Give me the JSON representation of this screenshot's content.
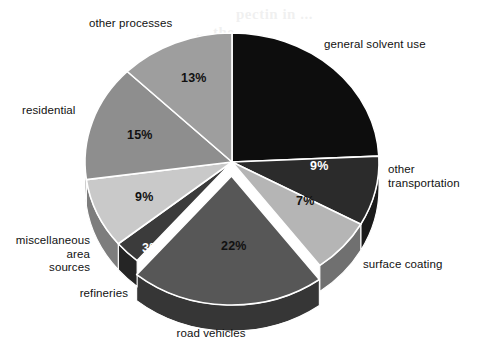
{
  "figure": {
    "kind": "3d-exploded-pie-chart",
    "background_color": "#ffffff",
    "ghost_text": {
      "note": "faint illegible bleed-through from reverse of printed page",
      "line1": "pectin in ...",
      "line2": "... the ...",
      "line3": "... it is ...",
      "line4": "... lite ..."
    }
  },
  "labels": {
    "general_solvent_use": "general solvent use",
    "other_transportation": "other\ntransportation",
    "surface_coating": "surface coating",
    "road_vehicles": "road vehicles",
    "refineries": "refineries",
    "miscellaneous_area_sources": "miscellaneous\narea\nsources",
    "residential": "residential",
    "other_processes": "other processes"
  },
  "value_labels": {
    "other_transportation": "9%",
    "surface_coating": "7%",
    "road_vehicles": "22%",
    "refineries": "3%",
    "miscellaneous_area_sources": "9%",
    "residential": "15%",
    "other_processes": "13%"
  },
  "chart_data": {
    "type": "pie",
    "title": "",
    "subtitle": "",
    "xlabel": "",
    "ylabel": "",
    "legend_position": "none-callout-labels",
    "grid": false,
    "exploded_slices": [
      "road vehicles"
    ],
    "start_angle_deg": 0,
    "direction": "clockwise",
    "units": "percent",
    "total_labeled_percent": 98,
    "categories": [
      "general solvent use",
      "other transportation",
      "surface coating",
      "road vehicles",
      "refineries",
      "miscellaneous area sources",
      "residential",
      "other processes"
    ],
    "values": [
      25,
      9,
      7,
      22,
      3,
      9,
      15,
      13
    ],
    "labels_shown": [
      "",
      "9%",
      "7%",
      "22%",
      "3%",
      "9%",
      "15%",
      "13%"
    ],
    "colors": [
      "#0d0d0d",
      "#2b2b2b",
      "#b5b5b5",
      "#575757",
      "#3b3b3b",
      "#c9c9c9",
      "#8e8e8e",
      "#9e9e9e"
    ],
    "slices": [
      {
        "name": "general solvent use",
        "value": 25,
        "label": "",
        "color": "#0d0d0d",
        "exploded": false
      },
      {
        "name": "other transportation",
        "value": 9,
        "label": "9%",
        "color": "#2b2b2b",
        "exploded": false
      },
      {
        "name": "surface coating",
        "value": 7,
        "label": "7%",
        "color": "#b5b5b5",
        "exploded": false
      },
      {
        "name": "road vehicles",
        "value": 22,
        "label": "22%",
        "color": "#575757",
        "exploded": true
      },
      {
        "name": "refineries",
        "value": 3,
        "label": "3%",
        "color": "#3b3b3b",
        "exploded": false
      },
      {
        "name": "miscellaneous area sources",
        "value": 9,
        "label": "9%",
        "color": "#c9c9c9",
        "exploded": false
      },
      {
        "name": "residential",
        "value": 15,
        "label": "15%",
        "color": "#8e8e8e",
        "exploded": false
      },
      {
        "name": "other processes",
        "value": 13,
        "label": "13%",
        "color": "#9e9e9e",
        "exploded": false
      }
    ]
  },
  "colors": {
    "slice_edge": "#ffffff",
    "text": "#111111",
    "value_text_dark": "#111111",
    "value_text_light": "#ffffff",
    "background": "#ffffff"
  }
}
